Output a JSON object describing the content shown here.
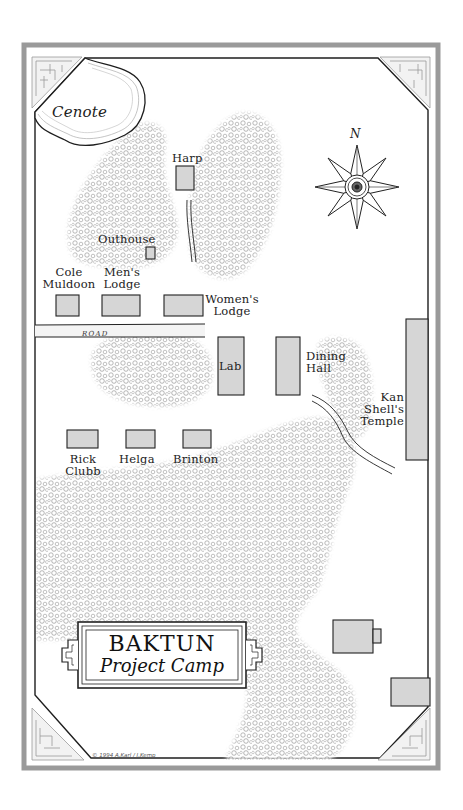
{
  "map": {
    "title": {
      "main": "BAKTUN",
      "sub": "Project Camp"
    },
    "credit": "© 1994 A.Karl / J.Kemp",
    "compass": {
      "label": "N",
      "icon": "eight-point-compass-rose"
    },
    "features": {
      "cenote": "Cenote",
      "road": "ROAD"
    },
    "buildings": [
      {
        "id": "harp",
        "label": "Harp"
      },
      {
        "id": "outhouse",
        "label": "Outhouse"
      },
      {
        "id": "cole-muldoon",
        "label": "Cole\nMuldoon",
        "line1": "Cole",
        "line2": "Muldoon"
      },
      {
        "id": "mens-lodge",
        "label": "Men's Lodge",
        "line1": "Men's",
        "line2": "Lodge"
      },
      {
        "id": "womens-lodge",
        "label": "Women's Lodge",
        "line1": "Women's",
        "line2": "Lodge"
      },
      {
        "id": "lab",
        "label": "Lab"
      },
      {
        "id": "dining-hall",
        "label": "Dining Hall",
        "line1": "Dining",
        "line2": "Hall"
      },
      {
        "id": "kan-shells-temple",
        "label": "Kan Shell's Temple",
        "line1": "Kan",
        "line2": "Shell's",
        "line3": "Temple"
      },
      {
        "id": "rick-clubb",
        "label": "Rick Clubb",
        "line1": "Rick",
        "line2": "Clubb"
      },
      {
        "id": "helga",
        "label": "Helga"
      },
      {
        "id": "brinton",
        "label": "Brinton"
      }
    ],
    "colors": {
      "building_fill": "#d6d6d6",
      "building_stroke": "#222222",
      "frame_gray": "#9a9a9a",
      "jungle_stipple": "#8a8a8a",
      "cenote_ring": "#aaaaaa"
    }
  }
}
